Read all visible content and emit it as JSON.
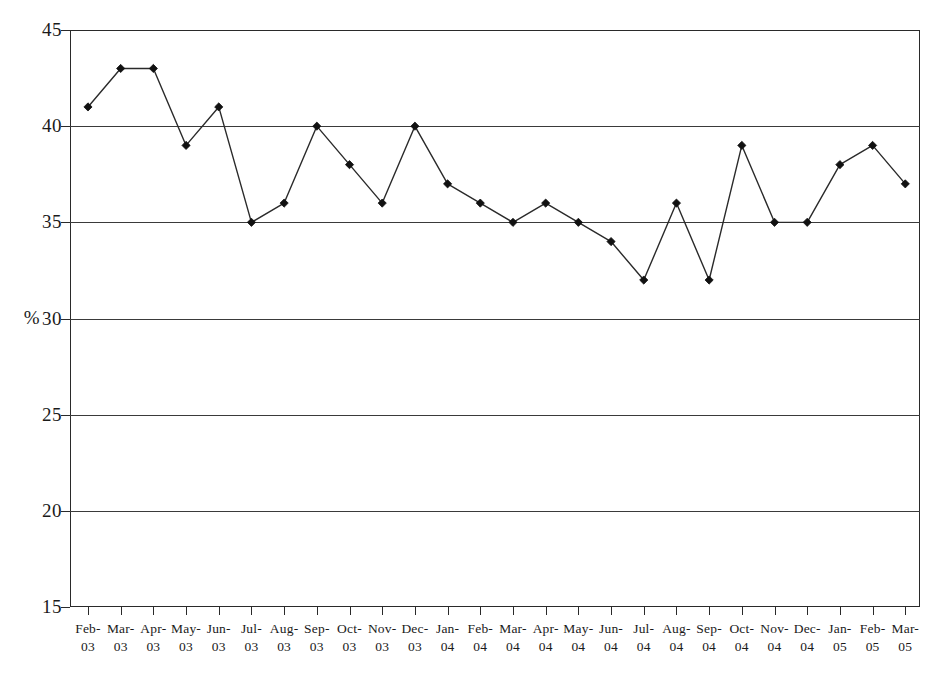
{
  "chart_data": {
    "type": "line",
    "title": "",
    "subtitle": "",
    "xlabel": "",
    "ylabel": "%",
    "ylim": [
      15,
      45
    ],
    "ytick_step": 5,
    "yticks": [
      45,
      40,
      35,
      30,
      25,
      20,
      15
    ],
    "grid": true,
    "grid_axis": "y",
    "legend": false,
    "legend_position": "none",
    "marker": "diamond",
    "line_color": "#2a2a2a",
    "marker_color": "#111111",
    "grid_color": "#3a3a3a",
    "categories": [
      "Feb-03",
      "Mar-03",
      "Apr-03",
      "May-03",
      "Jun-03",
      "Jul-03",
      "Aug-03",
      "Sep-03",
      "Oct-03",
      "Nov-03",
      "Dec-03",
      "Jan-04",
      "Feb-04",
      "Mar-04",
      "Apr-04",
      "May-04",
      "Jun-04",
      "Jul-04",
      "Aug-04",
      "Sep-04",
      "Oct-04",
      "Nov-04",
      "Dec-04",
      "Jan-05",
      "Feb-05",
      "Mar-05"
    ],
    "category_parts": [
      {
        "month": "Feb-",
        "year": "03"
      },
      {
        "month": "Mar-",
        "year": "03"
      },
      {
        "month": "Apr-",
        "year": "03"
      },
      {
        "month": "May-",
        "year": "03"
      },
      {
        "month": "Jun-",
        "year": "03"
      },
      {
        "month": "Jul-",
        "year": "03"
      },
      {
        "month": "Aug-",
        "year": "03"
      },
      {
        "month": "Sep-",
        "year": "03"
      },
      {
        "month": "Oct-",
        "year": "03"
      },
      {
        "month": "Nov-",
        "year": "03"
      },
      {
        "month": "Dec-",
        "year": "03"
      },
      {
        "month": "Jan-",
        "year": "04"
      },
      {
        "month": "Feb-",
        "year": "04"
      },
      {
        "month": "Mar-",
        "year": "04"
      },
      {
        "month": "Apr-",
        "year": "04"
      },
      {
        "month": "May-",
        "year": "04"
      },
      {
        "month": "Jun-",
        "year": "04"
      },
      {
        "month": "Jul-",
        "year": "04"
      },
      {
        "month": "Aug-",
        "year": "04"
      },
      {
        "month": "Sep-",
        "year": "04"
      },
      {
        "month": "Oct-",
        "year": "04"
      },
      {
        "month": "Nov-",
        "year": "04"
      },
      {
        "month": "Dec-",
        "year": "04"
      },
      {
        "month": "Jan-",
        "year": "05"
      },
      {
        "month": "Feb-",
        "year": "05"
      },
      {
        "month": "Mar-",
        "year": "05"
      }
    ],
    "values": [
      41,
      43,
      43,
      39,
      41,
      35,
      36,
      40,
      38,
      36,
      40,
      37,
      36,
      35,
      36,
      35,
      34,
      32,
      36,
      32,
      39,
      35,
      35,
      38,
      39,
      37
    ]
  }
}
